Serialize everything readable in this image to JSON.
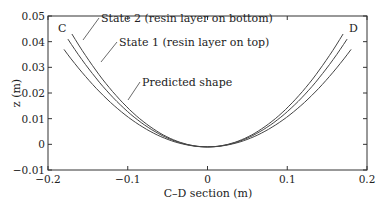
{
  "chart_data": {
    "type": "line",
    "title": "",
    "xlabel": "C–D section (m)",
    "ylabel": "z (m)",
    "xlim": [
      -0.2,
      0.2
    ],
    "ylim": [
      -0.01,
      0.05
    ],
    "xticks": [
      "-0.2",
      "-0.1",
      "0",
      "0.1",
      "0.2"
    ],
    "yticks": [
      "0.05",
      "0.04",
      "0.03",
      "0.02",
      "0.01",
      "0",
      "-0.01"
    ],
    "grid": false,
    "legend": "inline annotations",
    "corner_labels": {
      "left": "C",
      "right": "D"
    },
    "series": [
      {
        "name": "State 2 (resin layer on bottom)",
        "x": [
          -0.17,
          -0.1,
          -0.05,
          0,
          0.05,
          0.1,
          0.17
        ],
        "y": [
          0.043,
          0.015,
          0.003,
          -0.001,
          0.003,
          0.015,
          0.043
        ]
      },
      {
        "name": "State 1 (resin layer on top)",
        "x": [
          -0.175,
          -0.1,
          -0.05,
          0,
          0.05,
          0.1,
          0.175
        ],
        "y": [
          0.041,
          0.014,
          0.003,
          -0.001,
          0.003,
          0.014,
          0.041
        ]
      },
      {
        "name": "Predicted shape",
        "x": [
          -0.18,
          -0.1,
          -0.05,
          0,
          0.05,
          0.1,
          0.18
        ],
        "y": [
          0.037,
          0.012,
          0.002,
          -0.001,
          0.002,
          0.012,
          0.037
        ]
      }
    ]
  }
}
